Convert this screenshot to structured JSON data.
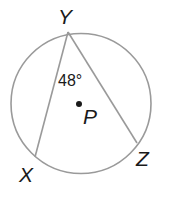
{
  "diagram": {
    "type": "inscribed-angle",
    "circle": {
      "center_label": "P",
      "cx": 81,
      "cy": 103,
      "r": 70
    },
    "points": {
      "Y": {
        "label": "Y",
        "x": 68,
        "y": 32
      },
      "X": {
        "label": "X",
        "x": 35,
        "y": 157
      },
      "Z": {
        "label": "Z",
        "x": 137,
        "y": 143
      }
    },
    "angle_label": "48°",
    "center_label": "P",
    "colors": {
      "stroke": "#9a9a9a",
      "text": "#1a1a1a"
    }
  }
}
